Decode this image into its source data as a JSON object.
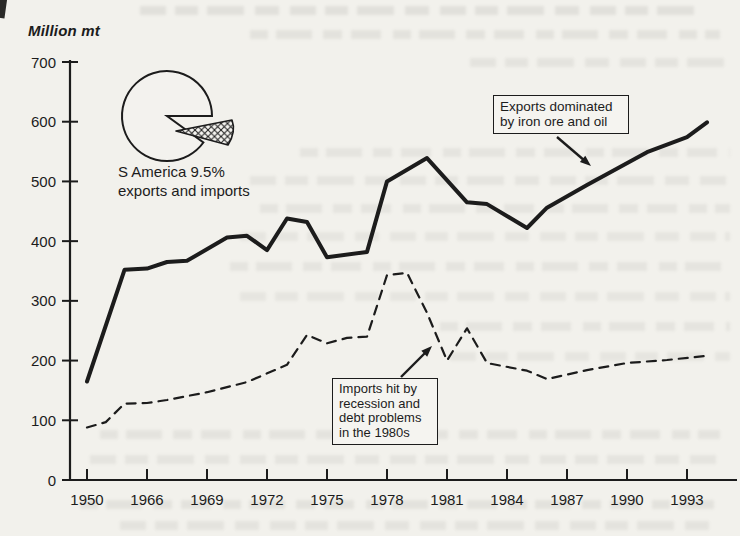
{
  "figure": {
    "axis_title": "Million mt",
    "pie_label": "S America 9.5%\nexports and imports",
    "annotations": {
      "exports": "Exports dominated\nby iron ore and oil",
      "imports": "Imports hit by\nrecession and\ndebt problems\nin the 1980s"
    }
  },
  "chart_data": {
    "type": "line",
    "title": "",
    "xlabel": "",
    "ylabel": "Million mt",
    "ylim": [
      0,
      700
    ],
    "y_ticks": [
      0,
      100,
      200,
      300,
      400,
      500,
      600,
      700
    ],
    "x_tick_years": [
      1950,
      1966,
      1969,
      1972,
      1975,
      1978,
      1981,
      1984,
      1987,
      1990,
      1993
    ],
    "x_axis_layout": "non-linear: single compressed interval 1950-1966, then 3-year intervals to 1993",
    "grid": false,
    "legend": "none (annotated arrows instead)",
    "series": [
      {
        "name": "Exports dominated by iron ore and oil",
        "style": "solid",
        "points": [
          [
            1950,
            165
          ],
          [
            1960,
            352
          ],
          [
            1966,
            354
          ],
          [
            1967,
            365
          ],
          [
            1968,
            367
          ],
          [
            1970,
            406
          ],
          [
            1971,
            409
          ],
          [
            1972,
            385
          ],
          [
            1973,
            438
          ],
          [
            1974,
            432
          ],
          [
            1975,
            373
          ],
          [
            1977,
            382
          ],
          [
            1978,
            500
          ],
          [
            1980,
            539
          ],
          [
            1982,
            465
          ],
          [
            1983,
            462
          ],
          [
            1985,
            422
          ],
          [
            1986,
            456
          ],
          [
            1988,
            494
          ],
          [
            1991,
            549
          ],
          [
            1993,
            574
          ],
          [
            1994,
            599
          ]
        ]
      },
      {
        "name": "Imports hit by recession and debt problems in the 1980s",
        "style": "dashed",
        "points": [
          [
            1950,
            88
          ],
          [
            1955,
            97
          ],
          [
            1960,
            128
          ],
          [
            1966,
            129
          ],
          [
            1967,
            134
          ],
          [
            1969,
            147
          ],
          [
            1971,
            164
          ],
          [
            1973,
            193
          ],
          [
            1974,
            243
          ],
          [
            1975,
            229
          ],
          [
            1976,
            238
          ],
          [
            1977,
            240
          ],
          [
            1978,
            343
          ],
          [
            1979,
            347
          ],
          [
            1980,
            280
          ],
          [
            1981,
            200
          ],
          [
            1982,
            254
          ],
          [
            1983,
            196
          ],
          [
            1985,
            183
          ],
          [
            1986,
            169
          ],
          [
            1988,
            184
          ],
          [
            1990,
            196
          ],
          [
            1992,
            201
          ],
          [
            1994,
            208
          ]
        ]
      }
    ],
    "pie_inset": {
      "type": "pie",
      "label": "S America 9.5% exports and imports",
      "slice_pct": 9.5,
      "exploded": true,
      "slice_fill": "crosshatch"
    }
  },
  "colors": {
    "ink": "#1c1c1c",
    "paper": "#f2f1ec"
  }
}
